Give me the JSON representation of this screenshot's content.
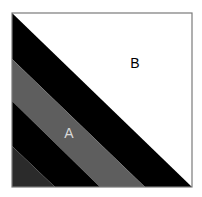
{
  "diagram": {
    "square": {
      "x": 12,
      "y": 13,
      "size": 180,
      "border_color": "#7a7a7a"
    },
    "regions": [
      {
        "name": "region-b",
        "color": "#ffffff",
        "points": "12,13 192,13 192,187"
      },
      {
        "name": "black-band-upper",
        "color": "#000000",
        "points": "12,13 192,187 145,187 12,59"
      },
      {
        "name": "gray-band-a",
        "color": "#5e5e5e",
        "points": "12,59 145,187 100,187 12,101"
      },
      {
        "name": "black-band-lower",
        "color": "#000000",
        "points": "12,101 100,187 55,187 12,146"
      },
      {
        "name": "dark-gray-corner",
        "color": "#2b2b2b",
        "points": "12,146 55,187 12,187"
      }
    ],
    "labels": {
      "b": {
        "text": "B",
        "x": 135,
        "y": 68,
        "color": "#000000"
      },
      "a": {
        "text": "A",
        "x": 69,
        "y": 138,
        "color": "#d8d8d8"
      }
    }
  }
}
